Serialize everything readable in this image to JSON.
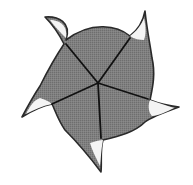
{
  "diagram": {
    "type": "pinwheel-pentagon",
    "colors": {
      "background": "#ffffff",
      "fill": "#7c7c7c",
      "outline": "#2a2a2a",
      "spokes": "#111111",
      "tip_highlight": "#f4f4f4"
    },
    "center": [
      98,
      83
    ],
    "tips": [
      {
        "name": "top-left",
        "point": [
          45,
          17
        ]
      },
      {
        "name": "top-right",
        "point": [
          145,
          11
        ]
      },
      {
        "name": "right",
        "point": [
          179,
          107
        ]
      },
      {
        "name": "bottom",
        "point": [
          101,
          172
        ]
      },
      {
        "name": "left",
        "point": [
          22,
          117
        ]
      }
    ],
    "spoke_ends": [
      [
        66,
        44
      ],
      [
        130,
        38
      ],
      [
        148,
        99
      ],
      [
        101,
        138
      ],
      [
        52,
        104
      ]
    ]
  }
}
